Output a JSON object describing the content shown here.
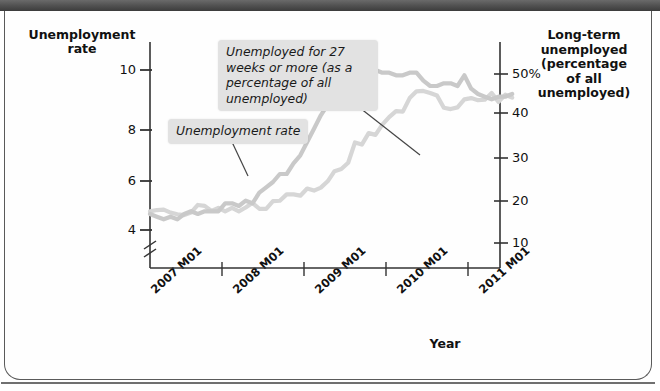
{
  "figure": {
    "y_left_title": "Unemployment\nrate",
    "y_right_title": "Long-term\nunemployed\n(percentage\nof all\nunemployed)",
    "x_title": "Year"
  },
  "callouts": {
    "long_term": "Unemployed for 27 weeks or more (as a percentage of all unemployed)",
    "unemployment_rate": "Unemployment rate"
  },
  "axis": {
    "left_ticks": [
      "10",
      "8",
      "6",
      "4"
    ],
    "right_ticks": [
      "50%",
      "40",
      "30",
      "20",
      "10"
    ],
    "x_ticks": [
      "2007 M01",
      "2008 M01",
      "2009 M01",
      "2010 M01",
      "2011 M01"
    ],
    "left_break_symbol": "axis-break"
  },
  "colors": {
    "curve_unemployment_rate": "#c9c9c9",
    "curve_long_term": "#d6d6d6",
    "axis": "#333333",
    "callout_background": "#e2e2e2",
    "frame": "#5a5a5a",
    "topbar": "#4f4f4f"
  },
  "chart_data": {
    "type": "line",
    "title": "",
    "xlabel": "Year",
    "ylabel": "Unemployment rate",
    "y2label": "Long-term unemployed (percentage of all unemployed)",
    "grid": false,
    "legend": "annotations",
    "x": [
      "2007 M01",
      "2007 M02",
      "2007 M03",
      "2007 M04",
      "2007 M05",
      "2007 M06",
      "2007 M07",
      "2007 M08",
      "2007 M09",
      "2007 M10",
      "2007 M11",
      "2007 M12",
      "2008 M01",
      "2008 M02",
      "2008 M03",
      "2008 M04",
      "2008 M05",
      "2008 M06",
      "2008 M07",
      "2008 M08",
      "2008 M09",
      "2008 M10",
      "2008 M11",
      "2008 M12",
      "2009 M01",
      "2009 M02",
      "2009 M03",
      "2009 M04",
      "2009 M05",
      "2009 M06",
      "2009 M07",
      "2009 M08",
      "2009 M09",
      "2009 M10",
      "2009 M11",
      "2009 M12",
      "2010 M01",
      "2010 M02",
      "2010 M03",
      "2010 M04",
      "2010 M05",
      "2010 M06",
      "2010 M07",
      "2010 M08",
      "2010 M09",
      "2010 M10",
      "2010 M11",
      "2010 M12",
      "2011 M01",
      "2011 M02",
      "2011 M03",
      "2011 M04",
      "2011 M05",
      "2011 M06"
    ],
    "series": [
      {
        "name": "Unemployment rate",
        "axis": "left",
        "units": "percent",
        "ylim": [
          3.5,
          11
        ],
        "color": "#c9c9c9",
        "values": [
          4.6,
          4.5,
          4.4,
          4.5,
          4.4,
          4.6,
          4.7,
          4.6,
          4.7,
          4.7,
          4.7,
          5.0,
          5.0,
          4.9,
          5.1,
          5.0,
          5.4,
          5.6,
          5.8,
          6.1,
          6.1,
          6.5,
          6.8,
          7.3,
          7.8,
          8.3,
          8.7,
          9.0,
          9.4,
          9.5,
          9.5,
          9.6,
          9.8,
          10.0,
          9.9,
          9.9,
          9.8,
          9.8,
          9.9,
          9.9,
          9.6,
          9.4,
          9.4,
          9.5,
          9.5,
          9.4,
          9.8,
          9.3,
          9.1,
          9.0,
          8.9,
          9.0,
          9.0,
          9.1
        ]
      },
      {
        "name": "Unemployed for 27 weeks or more (as a percentage of all unemployed)",
        "axis": "right",
        "units": "percent of all unemployed",
        "ylim": [
          5,
          55
        ],
        "color": "#d6d6d6",
        "values": [
          17.5,
          17.8,
          17.9,
          17.2,
          16.8,
          16.6,
          17.2,
          19.0,
          18.8,
          17.6,
          18.3,
          17.5,
          18.3,
          17.5,
          18.4,
          19.5,
          18.1,
          18.1,
          19.9,
          20.0,
          21.5,
          21.5,
          21.2,
          22.9,
          22.4,
          23.1,
          24.6,
          27.0,
          27.5,
          29.0,
          33.8,
          33.3,
          36.0,
          35.6,
          38.0,
          39.8,
          41.2,
          41.1,
          44.3,
          45.9,
          46.0,
          45.5,
          44.9,
          42.0,
          41.7,
          42.1,
          44.0,
          44.3,
          43.8,
          43.9,
          45.5,
          43.4,
          45.1,
          44.4
        ]
      }
    ],
    "annotations": [
      {
        "text": "Unemployment rate",
        "points_to_series": "Unemployment rate",
        "points_to_x": "2008 M06"
      },
      {
        "text": "Unemployed for 27 weeks or more (as a percentage of all unemployed)",
        "points_to_series": "Unemployed for 27 weeks or more (as a percentage of all unemployed)",
        "points_to_x": "2009 M11"
      }
    ]
  }
}
